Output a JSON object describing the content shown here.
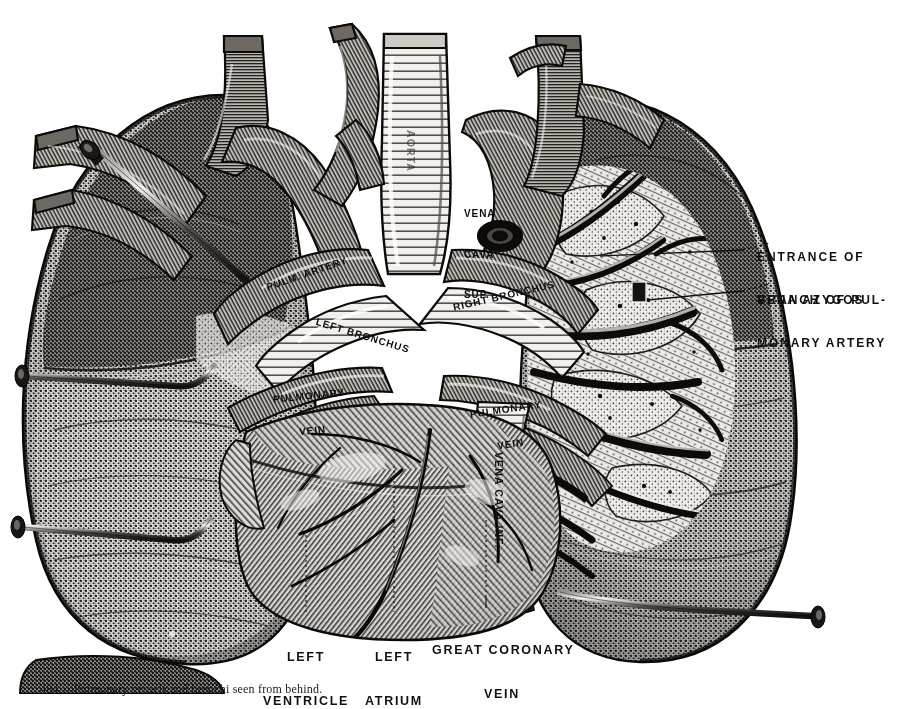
{
  "plate": {
    "type": "anatomical-engraving",
    "subject": "Posterior view of heart and lungs with dissected right lung root",
    "background_color": "#ffffff",
    "ink_color": "#1a1a1a"
  },
  "labels_right": [
    {
      "id": "entrance-vena-azygos",
      "lines": [
        "ENTRANCE OF",
        "VENA AZYGOS"
      ]
    },
    {
      "id": "branch-pulmonary-artery",
      "lines": [
        "BRANCH OF PUL-",
        "MONARY ARTERY"
      ]
    }
  ],
  "labels_bottom": [
    {
      "id": "left-ventricle",
      "lines": [
        "LEFT",
        "VENTRICLE"
      ]
    },
    {
      "id": "left-atrium",
      "lines": [
        "LEFT",
        "ATRIUM"
      ]
    },
    {
      "id": "great-coronary-vein",
      "lines": [
        "GREAT CORONARY",
        "VEIN"
      ]
    }
  ],
  "labels_inset": [
    {
      "id": "pulmonary-artery",
      "text": "PULM. ARTERY",
      "rotate": -19
    },
    {
      "id": "left-bronchus",
      "text": "LEFT BRONCHUS",
      "rotate": 17
    },
    {
      "id": "right-bronchus",
      "text": "RIGHT BRONCHUS",
      "rotate": -13
    },
    {
      "id": "pulmonary-vein-left",
      "lines": [
        "PULMONARY",
        "VEIN"
      ],
      "rotate": -6
    },
    {
      "id": "pulmonary-vein-right",
      "lines": [
        "PULMONARY",
        "VEIN"
      ],
      "rotate": -8
    },
    {
      "id": "vena-cava-sup",
      "lines": [
        "VENA",
        "CAVA",
        "SUP."
      ]
    },
    {
      "id": "vena-cava-inf",
      "text": "VENA CAVA INF.",
      "orientation": "vertical"
    },
    {
      "id": "aorta",
      "text": "AORTA",
      "orientation": "vertical"
    }
  ],
  "caption": {
    "text": "484.—Pulmonary vessels and bronchi seen from behind."
  },
  "pins": [
    {
      "id": "pin-upper-left",
      "head_x": 92,
      "head_y": 146,
      "tip_x": 243,
      "tip_y": 276
    },
    {
      "id": "pin-mid-left",
      "head_x": 18,
      "head_y": 375,
      "tip_x": 210,
      "tip_y": 392
    },
    {
      "id": "pin-lower-left",
      "head_x": 14,
      "head_y": 524,
      "tip_x": 205,
      "tip_y": 540
    },
    {
      "id": "pin-lower-right",
      "head_x": 820,
      "head_y": 615,
      "tip_x": 565,
      "tip_y": 592
    }
  ]
}
